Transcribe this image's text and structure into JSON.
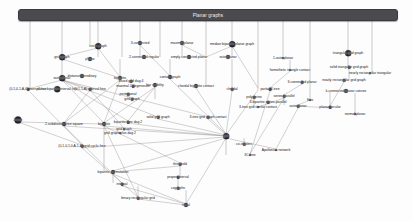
{
  "figure": {
    "type": "graph-class-inclusion-diagram",
    "background": "#fdfdfd",
    "edge_color": "#8d8d8d",
    "node_color": "#1d1d28",
    "banner_color": "#4a4a4f",
    "banner_text_color": "#f2f2f2"
  },
  "banner": {
    "label": "Planar graphs",
    "x": 18,
    "y": 9,
    "w": 378,
    "h": 10
  },
  "nodes": [
    {
      "label": "circle graph",
      "x": 98,
      "y": 46,
      "size": "s2"
    },
    {
      "label": "3-connected",
      "x": 140,
      "y": 43,
      "size": "s3"
    },
    {
      "label": "maximal planar",
      "x": 182,
      "y": 43,
      "size": "s3"
    },
    {
      "label": "median bipartite planar graph",
      "x": 232,
      "y": 44,
      "size": "s2"
    },
    {
      "label": "grid graph",
      "x": 62,
      "y": 57,
      "size": "s2"
    },
    {
      "label": "planar",
      "x": 90,
      "y": 59,
      "size": "s3"
    },
    {
      "label": "2-connected regular",
      "x": 144,
      "y": 57,
      "size": "s3"
    },
    {
      "label": "simply connected planar",
      "x": 189,
      "y": 57,
      "size": "s3"
    },
    {
      "label": "outerplanar",
      "x": 228,
      "y": 57,
      "size": "s3"
    },
    {
      "label": "1-outerplanar",
      "x": 283,
      "y": 58,
      "size": "s5"
    },
    {
      "label": "triangular grid graph",
      "x": 348,
      "y": 53,
      "size": "s2"
    },
    {
      "label": "solid triangular grid graph",
      "x": 349,
      "y": 67,
      "size": "s4"
    },
    {
      "label": "nearly rectangular triangular",
      "x": 370,
      "y": 73,
      "size": "s5"
    },
    {
      "label": "homothetic triangle contact",
      "x": 290,
      "y": 70,
      "size": "s5"
    },
    {
      "label": "nearly rectangular grid graph",
      "x": 344,
      "y": 80,
      "size": "s4"
    },
    {
      "label": "outerplanar",
      "x": 62,
      "y": 78,
      "size": "s2"
    },
    {
      "label": "distance-hereditary",
      "x": 82,
      "y": 76,
      "size": "s3"
    },
    {
      "label": "contact graph",
      "x": 170,
      "y": 77,
      "size": "s3"
    },
    {
      "label": "bipartite",
      "x": 120,
      "y": 78,
      "size": "s3"
    },
    {
      "label": "board grid dag 4",
      "x": 131,
      "y": 81,
      "size": "s4"
    },
    {
      "label": "maximal 2-degenerate",
      "x": 133,
      "y": 86,
      "size": "s4"
    },
    {
      "label": "bar visibility",
      "x": 155,
      "y": 85,
      "size": "s3"
    },
    {
      "label": "chordal bipartite contact",
      "x": 196,
      "y": 86,
      "size": "s3"
    },
    {
      "label": "3-connected planar",
      "x": 302,
      "y": 82,
      "size": "s4"
    },
    {
      "label": "k-connected planar convex",
      "x": 346,
      "y": 91,
      "size": "s3"
    },
    {
      "label": "(0,1,0,1,A,0) interval free",
      "x": 28,
      "y": 89,
      "size": "s4"
    },
    {
      "label": "planar bipartite interval free",
      "x": 57,
      "y": 89,
      "size": "s2"
    },
    {
      "label": "(0,1,1,A) interval free",
      "x": 90,
      "y": 89,
      "size": "s4"
    },
    {
      "label": "chordal",
      "x": 232,
      "y": 89,
      "size": "s4"
    },
    {
      "label": "partial 2-tree",
      "x": 270,
      "y": 89,
      "size": "s4"
    },
    {
      "label": "pentagonal",
      "x": 128,
      "y": 94,
      "size": "s4"
    },
    {
      "label": "grid graph",
      "x": 132,
      "y": 99,
      "size": "s4"
    },
    {
      "label": "polyomino",
      "x": 254,
      "y": 97,
      "size": "s4"
    },
    {
      "label": "series-parallel",
      "x": 284,
      "y": 96,
      "size": "s4"
    },
    {
      "label": "3-bipartite series-parallel",
      "x": 268,
      "y": 102,
      "size": "s4"
    },
    {
      "label": "outerplanar",
      "x": 298,
      "y": 106,
      "size": "s4"
    },
    {
      "label": "flats",
      "x": 310,
      "y": 100,
      "size": "s5"
    },
    {
      "label": "3-tree grid similar contact",
      "x": 258,
      "y": 107,
      "size": "s5"
    },
    {
      "label": "planar circular",
      "x": 330,
      "y": 107,
      "size": "s4"
    },
    {
      "label": "normal planar",
      "x": 355,
      "y": 114,
      "size": "s5"
    },
    {
      "label": "2-tree",
      "x": 18,
      "y": 120,
      "size": "s1"
    },
    {
      "label": "2-subdivision tree square",
      "x": 64,
      "y": 124,
      "size": "s3"
    },
    {
      "label": "bipartite",
      "x": 104,
      "y": 124,
      "size": "s3"
    },
    {
      "label": "bipartite tree dag 2",
      "x": 128,
      "y": 122,
      "size": "s4"
    },
    {
      "label": "solid grid graph",
      "x": 158,
      "y": 117,
      "size": "s4"
    },
    {
      "label": "3-tree grid graph contact",
      "x": 208,
      "y": 117,
      "size": "s4"
    },
    {
      "label": "grid graph",
      "x": 124,
      "y": 129,
      "size": "s5"
    },
    {
      "label": "grid graph plus dag 2",
      "x": 120,
      "y": 133,
      "size": "s5"
    },
    {
      "label": "(0,1,0,1,0,A,1,A) grid cyclic free",
      "x": 82,
      "y": 146,
      "size": "s4"
    },
    {
      "label": "grid",
      "x": 226,
      "y": 136,
      "size": "s2"
    },
    {
      "label": "co-regions",
      "x": 244,
      "y": 144,
      "size": "s4"
    },
    {
      "label": "Apollonian network",
      "x": 276,
      "y": 150,
      "size": "s5"
    },
    {
      "label": "3C-free",
      "x": 250,
      "y": 155,
      "size": "s5"
    },
    {
      "label": "bipartite permutation",
      "x": 113,
      "y": 172,
      "size": "s3"
    },
    {
      "label": "threshold",
      "x": 180,
      "y": 164,
      "size": "s4"
    },
    {
      "label": "interval",
      "x": 122,
      "y": 184,
      "size": "s4"
    },
    {
      "label": "proper interval",
      "x": 178,
      "y": 177,
      "size": "s4"
    },
    {
      "label": "cographs",
      "x": 178,
      "y": 188,
      "size": "s4"
    },
    {
      "label": "binary rectangular grid",
      "x": 138,
      "y": 198,
      "size": "s4"
    },
    {
      "label": "trivial",
      "x": 186,
      "y": 205,
      "size": "s3"
    }
  ],
  "verticals": [
    {
      "x": 30,
      "y1": 19,
      "y2": 90
    },
    {
      "x": 62,
      "y1": 19,
      "y2": 57
    },
    {
      "x": 90,
      "y1": 19,
      "y2": 46
    },
    {
      "x": 98,
      "y1": 19,
      "y2": 44
    },
    {
      "x": 122,
      "y1": 19,
      "y2": 57
    },
    {
      "x": 140,
      "y1": 19,
      "y2": 41
    },
    {
      "x": 160,
      "y1": 19,
      "y2": 57
    },
    {
      "x": 182,
      "y1": 19,
      "y2": 41
    },
    {
      "x": 206,
      "y1": 19,
      "y2": 57
    },
    {
      "x": 232,
      "y1": 19,
      "y2": 42
    },
    {
      "x": 258,
      "y1": 19,
      "y2": 90
    },
    {
      "x": 283,
      "y1": 19,
      "y2": 57
    },
    {
      "x": 310,
      "y1": 19,
      "y2": 100
    },
    {
      "x": 348,
      "y1": 19,
      "y2": 51
    },
    {
      "x": 372,
      "y1": 19,
      "y2": 73
    },
    {
      "x": 98,
      "y1": 48,
      "y2": 57
    },
    {
      "x": 140,
      "y1": 45,
      "y2": 57
    },
    {
      "x": 182,
      "y1": 45,
      "y2": 57
    },
    {
      "x": 232,
      "y1": 46,
      "y2": 57
    },
    {
      "x": 348,
      "y1": 55,
      "y2": 66
    },
    {
      "x": 349,
      "y1": 69,
      "y2": 79
    },
    {
      "x": 62,
      "y1": 59,
      "y2": 77
    },
    {
      "x": 120,
      "y1": 59,
      "y2": 77
    },
    {
      "x": 170,
      "y1": 59,
      "y2": 76
    },
    {
      "x": 206,
      "y1": 59,
      "y2": 86
    },
    {
      "x": 232,
      "y1": 59,
      "y2": 88
    },
    {
      "x": 290,
      "y1": 60,
      "y2": 69
    },
    {
      "x": 155,
      "y1": 87,
      "y2": 99
    },
    {
      "x": 128,
      "y1": 96,
      "y2": 99
    },
    {
      "x": 254,
      "y1": 99,
      "y2": 107
    },
    {
      "x": 284,
      "y1": 98,
      "y2": 105
    },
    {
      "x": 330,
      "y1": 92,
      "y2": 106
    },
    {
      "x": 355,
      "y1": 93,
      "y2": 113
    },
    {
      "x": 226,
      "y1": 138,
      "y2": 155
    },
    {
      "x": 244,
      "y1": 138,
      "y2": 143
    },
    {
      "x": 180,
      "y1": 166,
      "y2": 176
    },
    {
      "x": 178,
      "y1": 179,
      "y2": 187
    },
    {
      "x": 186,
      "y1": 190,
      "y2": 204
    },
    {
      "x": 138,
      "y1": 186,
      "y2": 197
    },
    {
      "x": 104,
      "y1": 126,
      "y2": 171
    },
    {
      "x": 113,
      "y1": 174,
      "y2": 183
    }
  ],
  "diagonals": [
    {
      "x1": 62,
      "y1": 59,
      "x2": 120,
      "y2": 78
    },
    {
      "x1": 98,
      "y1": 48,
      "x2": 62,
      "y2": 57
    },
    {
      "x1": 98,
      "y1": 48,
      "x2": 120,
      "y2": 77
    },
    {
      "x1": 140,
      "y1": 45,
      "x2": 170,
      "y2": 76
    },
    {
      "x1": 182,
      "y1": 45,
      "x2": 206,
      "y2": 57
    },
    {
      "x1": 232,
      "y1": 46,
      "x2": 206,
      "y2": 57
    },
    {
      "x1": 232,
      "y1": 46,
      "x2": 258,
      "y2": 88
    },
    {
      "x1": 62,
      "y1": 80,
      "x2": 28,
      "y2": 89
    },
    {
      "x1": 62,
      "y1": 80,
      "x2": 90,
      "y2": 89
    },
    {
      "x1": 62,
      "y1": 80,
      "x2": 104,
      "y2": 123
    },
    {
      "x1": 62,
      "y1": 80,
      "x2": 128,
      "y2": 121
    },
    {
      "x1": 62,
      "y1": 80,
      "x2": 158,
      "y2": 117
    },
    {
      "x1": 62,
      "y1": 80,
      "x2": 208,
      "y2": 117
    },
    {
      "x1": 90,
      "y1": 90,
      "x2": 64,
      "y2": 123
    },
    {
      "x1": 90,
      "y1": 90,
      "x2": 124,
      "y2": 128
    },
    {
      "x1": 120,
      "y1": 80,
      "x2": 64,
      "y2": 123
    },
    {
      "x1": 120,
      "y1": 80,
      "x2": 104,
      "y2": 123
    },
    {
      "x1": 155,
      "y1": 87,
      "x2": 104,
      "y2": 123
    },
    {
      "x1": 155,
      "y1": 87,
      "x2": 128,
      "y2": 121
    },
    {
      "x1": 158,
      "y1": 119,
      "x2": 226,
      "y2": 135
    },
    {
      "x1": 208,
      "y1": 119,
      "x2": 226,
      "y2": 135
    },
    {
      "x1": 128,
      "y1": 123,
      "x2": 226,
      "y2": 136
    },
    {
      "x1": 104,
      "y1": 126,
      "x2": 226,
      "y2": 136
    },
    {
      "x1": 64,
      "y1": 126,
      "x2": 226,
      "y2": 136
    },
    {
      "x1": 82,
      "y1": 148,
      "x2": 226,
      "y2": 137
    },
    {
      "x1": 226,
      "y1": 138,
      "x2": 276,
      "y2": 149
    },
    {
      "x1": 226,
      "y1": 138,
      "x2": 186,
      "y2": 204
    },
    {
      "x1": 226,
      "y1": 138,
      "x2": 113,
      "y2": 171
    },
    {
      "x1": 104,
      "y1": 126,
      "x2": 138,
      "y2": 197
    },
    {
      "x1": 113,
      "y1": 174,
      "x2": 186,
      "y2": 204
    },
    {
      "x1": 138,
      "y1": 199,
      "x2": 186,
      "y2": 205
    },
    {
      "x1": 122,
      "y1": 186,
      "x2": 186,
      "y2": 204
    },
    {
      "x1": 180,
      "y1": 166,
      "x2": 113,
      "y2": 172
    },
    {
      "x1": 258,
      "y1": 90,
      "x2": 226,
      "y2": 135
    },
    {
      "x1": 284,
      "y1": 98,
      "x2": 258,
      "y2": 107
    },
    {
      "x1": 330,
      "y1": 108,
      "x2": 298,
      "y2": 106
    },
    {
      "x1": 310,
      "y1": 100,
      "x2": 298,
      "y2": 105
    },
    {
      "x1": 290,
      "y1": 71,
      "x2": 270,
      "y2": 88
    },
    {
      "x1": 344,
      "y1": 82,
      "x2": 330,
      "y2": 106
    },
    {
      "x1": 302,
      "y1": 84,
      "x2": 284,
      "y2": 95
    },
    {
      "x1": 30,
      "y1": 92,
      "x2": 82,
      "y2": 145
    },
    {
      "x1": 18,
      "y1": 122,
      "x2": 104,
      "y2": 124
    },
    {
      "x1": 18,
      "y1": 122,
      "x2": 82,
      "y2": 145
    },
    {
      "x1": 170,
      "y1": 79,
      "x2": 226,
      "y2": 134
    },
    {
      "x1": 196,
      "y1": 88,
      "x2": 226,
      "y2": 134
    },
    {
      "x1": 232,
      "y1": 91,
      "x2": 226,
      "y2": 134
    },
    {
      "x1": 270,
      "y1": 91,
      "x2": 250,
      "y2": 154
    },
    {
      "x1": 284,
      "y1": 98,
      "x2": 250,
      "y2": 154
    },
    {
      "x1": 298,
      "y1": 108,
      "x2": 276,
      "y2": 149
    },
    {
      "x1": 104,
      "y1": 126,
      "x2": 180,
      "y2": 163
    },
    {
      "x1": 64,
      "y1": 126,
      "x2": 122,
      "y2": 183
    },
    {
      "x1": 82,
      "y1": 148,
      "x2": 138,
      "y2": 197
    }
  ]
}
